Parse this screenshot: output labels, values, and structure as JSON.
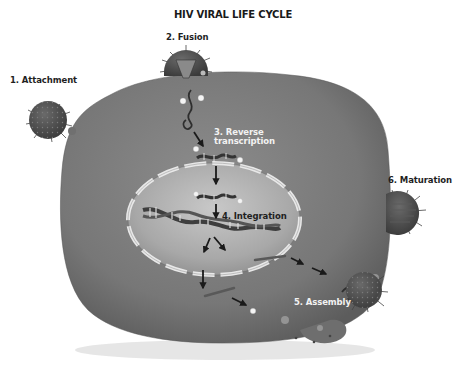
{
  "title": "HIV VIRAL LIFE CYCLE",
  "steps": [
    {
      "number": 1,
      "label": "1. Attachment"
    },
    {
      "number": 2,
      "label": "2. Fusion"
    },
    {
      "number": 3,
      "label_line1": "3. Reverse",
      "label_line2": "transcription"
    },
    {
      "number": 4,
      "label": "4. Integration"
    },
    {
      "number": 5,
      "label": "5. Assembly"
    },
    {
      "number": 6,
      "label": "6. Maturation"
    }
  ],
  "colors": {
    "cell": "#7a7a7a",
    "cell_dark": "#5e5e5e",
    "nucleus": "#a9a9a9",
    "nucleus_light": "#c6c6c6",
    "nuclear_envelope": "#e6e6e6",
    "virus": "#4f4f4f",
    "dna": "#3a3a3a",
    "arrow": "#1a1a1a",
    "background": "#ffffff"
  }
}
